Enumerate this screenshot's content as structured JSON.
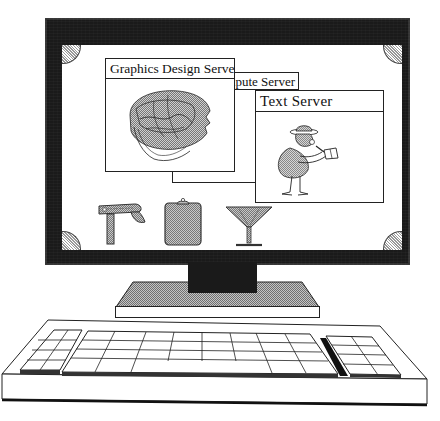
{
  "screen": {
    "windows": [
      {
        "id": "graphics",
        "title": "Graphics Design Server",
        "content": "interlocking-heads-illustration"
      },
      {
        "id": "compute",
        "title": "Compute Server",
        "visible_title": "npute Server",
        "content": "empty"
      },
      {
        "id": "text",
        "title": "Text Server",
        "content": "reporter-character-illustration"
      }
    ],
    "dock_icons": [
      {
        "id": "stapler",
        "name": "stapler-icon"
      },
      {
        "id": "clipboard",
        "name": "clipboard-icon"
      },
      {
        "id": "glass",
        "name": "martini-glass-icon"
      }
    ]
  },
  "colors": {
    "bezel": "#1a1a1a",
    "screen": "#ffffff",
    "line": "#222222",
    "dither_light": "#bdbdbd",
    "dither_dark": "#8a8a8a"
  }
}
